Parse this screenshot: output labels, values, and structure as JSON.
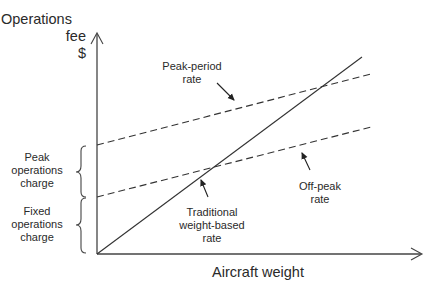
{
  "axes": {
    "y_label": [
      "Operations",
      "fee",
      "$"
    ],
    "x_label": "Aircraft weight"
  },
  "lines": [
    {
      "name": "Peak-period rate",
      "style": "dashed",
      "from": [
        97,
        145
      ],
      "to": [
        371,
        74
      ]
    },
    {
      "name": "Off-peak rate",
      "style": "dashed",
      "from": [
        97,
        197
      ],
      "to": [
        371,
        127
      ]
    },
    {
      "name": "Traditional weight-based rate",
      "style": "solid",
      "from": [
        97,
        254
      ],
      "to": [
        362,
        57
      ]
    }
  ],
  "annotations": {
    "peak_period": [
      "Peak-period",
      "rate"
    ],
    "off_peak": [
      "Off-peak",
      "rate"
    ],
    "traditional": [
      "Traditional",
      "weight-based",
      "rate"
    ]
  },
  "braces": {
    "peak_charge": [
      "Peak",
      "operations",
      "charge"
    ],
    "fixed_charge": [
      "Fixed",
      "operations",
      "charge"
    ]
  },
  "colors": {
    "line": "#333333",
    "text": "#2a2a2a",
    "background": "#ffffff"
  }
}
